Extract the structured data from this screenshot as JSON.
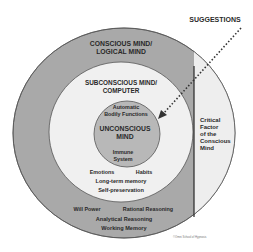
{
  "diagram": {
    "colors": {
      "outer_ring": "#a9a9a9",
      "middle_circle": "#f0f0f0",
      "inner_circle": "#b8b8b8",
      "critical_region": "#eeeeee",
      "stroke": "#555555",
      "text": "#2a2a2a"
    },
    "suggestions_label": "SUGGESTIONS",
    "outer": {
      "title_line1": "CONSCIOUS MIND/",
      "title_line2": "LOGICAL MIND",
      "items": {
        "will_power": "Will Power",
        "rational_reasoning": "Rational Reasoning",
        "analytical_reasoning": "Analytical Reasoning",
        "working_memory": "Working Memory"
      }
    },
    "middle": {
      "title_line1": "SUBCONSCIOUS MIND/",
      "title_line2": "COMPUTER",
      "items": {
        "emotions": "Emotions",
        "habits": "Habits",
        "long_term_memory": "Long-term memory",
        "self_preservation": "Self-preservation"
      }
    },
    "inner": {
      "top_line1": "Automatic",
      "top_line2": "Bodily Functions",
      "title_line1": "UNCONSCIOUS",
      "title_line2": "MIND",
      "bottom_line1": "Immune",
      "bottom_line2": "System"
    },
    "critical_factor": {
      "line1": "Critical",
      "line2": "Factor",
      "line3": "of the",
      "line4": "Conscious",
      "line5": "Mind"
    },
    "credit": "©Omni School of Hypnosis"
  }
}
